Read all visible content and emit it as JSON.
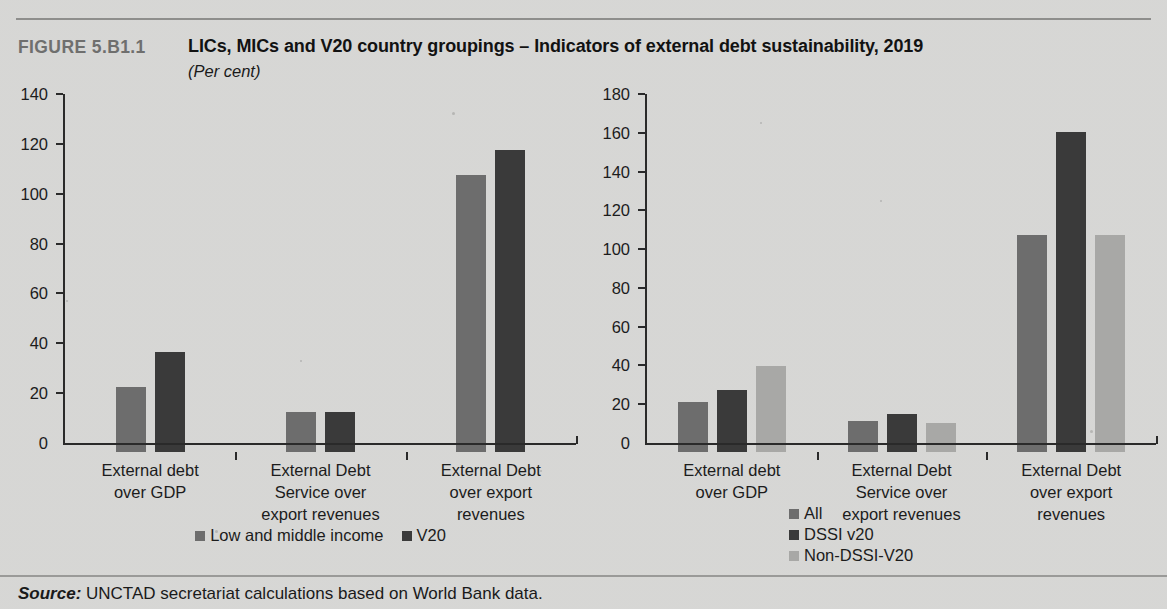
{
  "figure": {
    "number": "FIGURE 5.B1.1",
    "title": "LICs, MICs and V20 country groupings – Indicators of external debt sustainability, 2019",
    "subtitle": "(Per cent)"
  },
  "source": {
    "label": "Source:",
    "text": "UNCTAD secretariat calculations based on World Bank data."
  },
  "chart_data": [
    {
      "id": "left",
      "type": "bar",
      "title": "",
      "xlabel": "",
      "ylabel": "",
      "ylim": [
        0,
        140
      ],
      "yticks": [
        0,
        20,
        40,
        60,
        80,
        100,
        120,
        140
      ],
      "ytick_labels": [
        "0",
        "20",
        "40",
        "60",
        "80",
        "100",
        "120",
        "140"
      ],
      "grid": false,
      "legend_position": "bottom",
      "categories": [
        "External debt over GDP",
        "External Debt Service over export revenues",
        "External Debt over export revenues"
      ],
      "category_lines": [
        [
          "External debt",
          "over GDP"
        ],
        [
          "External Debt",
          "Service over",
          "export revenues"
        ],
        [
          "External Debt",
          "over export",
          "revenues"
        ]
      ],
      "series": [
        {
          "name": "Low and middle income",
          "color": "#6d6d6d",
          "values": [
            26,
            16,
            111
          ]
        },
        {
          "name": "V20",
          "color": "#3a3a3a",
          "values": [
            40,
            16,
            121
          ]
        }
      ]
    },
    {
      "id": "right",
      "type": "bar",
      "title": "",
      "xlabel": "",
      "ylabel": "",
      "ylim": [
        0,
        180
      ],
      "yticks": [
        0,
        20,
        40,
        60,
        80,
        100,
        120,
        140,
        160,
        180
      ],
      "ytick_labels": [
        "0",
        "20",
        "40",
        "60",
        "80",
        "100",
        "120",
        "140",
        "160",
        "180"
      ],
      "grid": false,
      "legend_position": "bottom-left",
      "categories": [
        "External debt over GDP",
        "External Debt Service over export revenues",
        "External Debt over export revenues"
      ],
      "category_lines": [
        [
          "External debt",
          "over GDP"
        ],
        [
          "External Debt",
          "Service over",
          "export revenues"
        ],
        [
          "External Debt",
          "over export",
          "revenues"
        ]
      ],
      "series": [
        {
          "name": "All",
          "color": "#6d6d6d",
          "values": [
            26,
            16,
            112
          ]
        },
        {
          "name": "DSSI v20",
          "color": "#3a3a3a",
          "values": [
            32,
            19.5,
            165
          ]
        },
        {
          "name": "Non-DSSI-V20",
          "color": "#a8a8a6",
          "values": [
            44.5,
            15,
            112
          ]
        }
      ]
    }
  ]
}
